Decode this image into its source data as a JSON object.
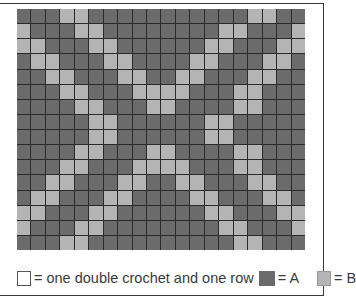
{
  "chart_title": "",
  "legend": {
    "empty_swatch_text": "= one double crochet and one row",
    "a_text": "= A",
    "b_text": "= B",
    "colors": {
      "A": "#6b6b6b",
      "B": "#b4b4b4",
      "gridline": "#2a2a2a"
    }
  },
  "grid": {
    "columns": 20,
    "rows": 16,
    "pattern": [
      "AAABBAAAAAAAAAAABBAAA",
      "BAAABBAAAAAAAABBAAAB",
      "BBAAABBAAAAAABBAAABB",
      "ABBAAABBAAAABBAAABBA",
      "AABBAAABBAABBAAABBAA",
      "AAABBAAABBBBAAABBAAA",
      "AAAABBAAABBAAAABBAAA",
      "AAAAABBAAAAAABBAAAAA",
      "AAAAABBAAAAAABBAAAAA",
      "AAAABBAAABBAAAABBAAA",
      "AAABBAAABBBBAAABBAAA",
      "AABBAAABBAABBAAABBAA",
      "ABBAAABBAAAABBAAABBA",
      "BBAAABBAAAAAABBAAABB",
      "BAAABBAAAAAAAABBAAAB",
      "AAABBAAAAAAAAAABBAAA"
    ]
  }
}
